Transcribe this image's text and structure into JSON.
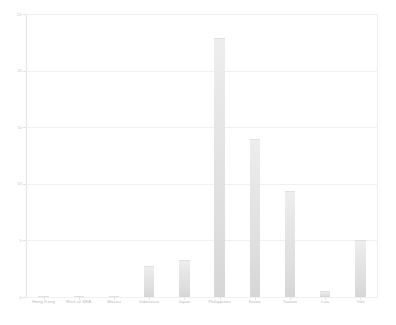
{
  "chart_data": {
    "type": "bar",
    "title": "",
    "subtitle": "",
    "xlabel": "",
    "ylabel": "",
    "categories": [
      "Hong Kong",
      "Rest of SEA",
      "Macau",
      "Indonesia",
      "Japan",
      "Philippines",
      "Korea",
      "Taiwan",
      "Lao",
      "Viet"
    ],
    "values": [
      0.1,
      0.1,
      0.1,
      2.7,
      3.3,
      22.9,
      14.0,
      9.4,
      0.5,
      5.0
    ],
    "ylim": [
      0,
      25
    ],
    "yticks": [
      0,
      5,
      10,
      15,
      20,
      25
    ],
    "ytick_labels": [
      "0",
      "5",
      "10",
      "15",
      "20",
      "25"
    ],
    "grid": true,
    "legend": false,
    "bar_color": "#e4e4e4",
    "grid_color": "#f1f0ef",
    "axis_color": "#e3e3e3",
    "tick_label_color": "#c3c3c3"
  }
}
